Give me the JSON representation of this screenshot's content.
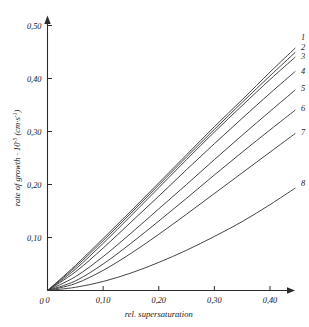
{
  "chart_data": {
    "type": "line",
    "title": "",
    "xlabel": "rel. supersaturation",
    "ylabel": "rate of growth · 10",
    "ylabel_exp": "-5",
    "ylabel_unit": "(cm·s",
    "ylabel_unit_exp": "-1",
    "ylabel_unit_close": ")",
    "xlim": [
      0,
      0.48
    ],
    "ylim": [
      0,
      0.52
    ],
    "xticks": [
      0,
      0.1,
      0.2,
      0.3,
      0.4
    ],
    "xticklabels": [
      "0",
      "0,10",
      "0,20",
      "0,30",
      "0,40"
    ],
    "yticks": [
      0,
      0.1,
      0.2,
      0.3,
      0.4,
      0.5
    ],
    "yticklabels": [
      "0",
      "0,10",
      "0,20",
      "0,30",
      "0,40",
      "0,50"
    ],
    "grid": false,
    "legend": "curve-end-labels",
    "series": [
      {
        "name": "1",
        "label": "1",
        "x": [
          0.0,
          0.05,
          0.1,
          0.15,
          0.2,
          0.25,
          0.3,
          0.35,
          0.4,
          0.445
        ],
        "y": [
          0.0,
          0.047,
          0.098,
          0.15,
          0.203,
          0.256,
          0.309,
          0.36,
          0.412,
          0.457
        ]
      },
      {
        "name": "2",
        "label": "2",
        "x": [
          0.0,
          0.05,
          0.1,
          0.15,
          0.2,
          0.25,
          0.3,
          0.35,
          0.4,
          0.445
        ],
        "y": [
          0.0,
          0.044,
          0.094,
          0.146,
          0.199,
          0.252,
          0.304,
          0.355,
          0.405,
          0.449
        ]
      },
      {
        "name": "3",
        "label": "3",
        "x": [
          0.0,
          0.05,
          0.1,
          0.15,
          0.2,
          0.25,
          0.3,
          0.35,
          0.4,
          0.445
        ],
        "y": [
          0.0,
          0.04,
          0.089,
          0.141,
          0.194,
          0.247,
          0.299,
          0.349,
          0.398,
          0.44
        ]
      },
      {
        "name": "4",
        "label": "4",
        "x": [
          0.0,
          0.05,
          0.1,
          0.15,
          0.2,
          0.25,
          0.3,
          0.35,
          0.4,
          0.445
        ],
        "y": [
          0.0,
          0.035,
          0.08,
          0.129,
          0.178,
          0.228,
          0.277,
          0.325,
          0.372,
          0.413
        ]
      },
      {
        "name": "5",
        "label": "5",
        "x": [
          0.0,
          0.05,
          0.1,
          0.15,
          0.2,
          0.25,
          0.3,
          0.35,
          0.4,
          0.445
        ],
        "y": [
          0.0,
          0.026,
          0.064,
          0.108,
          0.154,
          0.2,
          0.247,
          0.293,
          0.338,
          0.378
        ]
      },
      {
        "name": "6",
        "label": "6",
        "x": [
          0.0,
          0.05,
          0.1,
          0.15,
          0.2,
          0.25,
          0.3,
          0.35,
          0.4,
          0.445
        ],
        "y": [
          0.0,
          0.018,
          0.05,
          0.089,
          0.131,
          0.174,
          0.218,
          0.261,
          0.303,
          0.34
        ]
      },
      {
        "name": "7",
        "label": "7",
        "x": [
          0.0,
          0.05,
          0.1,
          0.15,
          0.2,
          0.25,
          0.3,
          0.35,
          0.4,
          0.445
        ],
        "y": [
          0.0,
          0.013,
          0.038,
          0.07,
          0.106,
          0.144,
          0.183,
          0.222,
          0.261,
          0.296
        ]
      },
      {
        "name": "8",
        "label": "8",
        "x": [
          0.0,
          0.05,
          0.1,
          0.15,
          0.2,
          0.25,
          0.3,
          0.35,
          0.4,
          0.445
        ],
        "y": [
          0.0,
          0.006,
          0.017,
          0.033,
          0.053,
          0.076,
          0.102,
          0.13,
          0.162,
          0.193
        ]
      }
    ]
  }
}
